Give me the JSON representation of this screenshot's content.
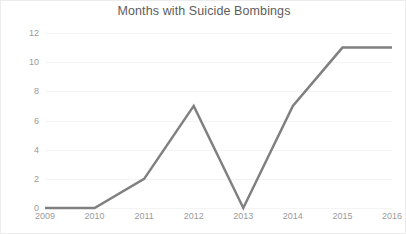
{
  "chart_data": {
    "type": "line",
    "title": "Months with Suicide Bombings",
    "xlabel": "",
    "ylabel": "",
    "categories": [
      "2009",
      "2010",
      "2011",
      "2012",
      "2013",
      "2014",
      "2015",
      "2016"
    ],
    "values": [
      0,
      0,
      2,
      7,
      0,
      7,
      11,
      11
    ],
    "series": [
      {
        "name": "Months with Suicide Bombings",
        "values": [
          0,
          0,
          2,
          7,
          0,
          7,
          11,
          11
        ]
      }
    ],
    "ylim": [
      0,
      12
    ],
    "yticks": [
      0,
      2,
      4,
      6,
      8,
      10,
      12
    ],
    "ytick_labels": [
      "0",
      "2",
      "4",
      "6",
      "8",
      "10",
      "12"
    ],
    "xtick_labels": [
      "2009",
      "2010",
      "2011",
      "2012",
      "2013",
      "2014",
      "2015",
      "2016"
    ],
    "grid": true,
    "grid_axis": "y",
    "legend": false,
    "legend_position": "none",
    "markers": false,
    "line_color": "#808080",
    "line_width": 2.5,
    "grid_color": "#f4f4f5",
    "tick_label_color": "#9a9a9a",
    "title_color": "#5d5d5d",
    "background_color": "#ffffff",
    "border_color": "#ececed"
  }
}
